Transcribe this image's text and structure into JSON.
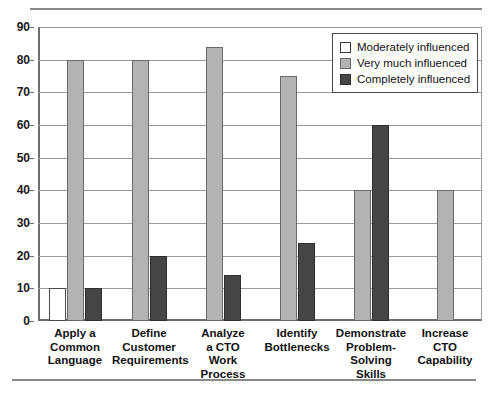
{
  "chart_data": {
    "type": "bar",
    "title": "",
    "xlabel": "",
    "ylabel": "",
    "ylim": [
      0,
      90
    ],
    "ytick_step": 10,
    "yticks": [
      90,
      80,
      70,
      60,
      50,
      40,
      30,
      20,
      10,
      0
    ],
    "grid": true,
    "legend_position": "top-right",
    "categories": [
      "Apply a Common Language",
      "Define Customer Requirements",
      "Analyze a CTO Work Process",
      "Identify Bottlenecks",
      "Demonstrate Problem-Solving Skills",
      "Increase CTO Capability"
    ],
    "category_lines": [
      [
        "Apply a",
        "Common",
        "Language"
      ],
      [
        "Define",
        "Customer",
        "Requirements"
      ],
      [
        "Analyze",
        "a CTO",
        "Work",
        "Process"
      ],
      [
        "Identify",
        "Bottlenecks"
      ],
      [
        "Demonstrate",
        "Problem-",
        "Solving",
        "Skills"
      ],
      [
        "Increase",
        "CTO",
        "Capability"
      ]
    ],
    "series": [
      {
        "name": "Moderately influenced",
        "color": "#ffffff",
        "values": [
          10,
          0,
          0,
          0,
          0,
          0
        ]
      },
      {
        "name": "Very much influenced",
        "color": "#b3b3b3",
        "values": [
          80,
          80,
          84,
          75,
          40,
          40
        ]
      },
      {
        "name": "Completely influenced",
        "color": "#454545",
        "values": [
          10,
          20,
          14,
          24,
          60,
          0
        ]
      }
    ]
  },
  "legend": {
    "items": [
      {
        "label": "Moderately influenced",
        "swatch": "moderate"
      },
      {
        "label": "Very much influenced",
        "swatch": "very"
      },
      {
        "label": "Completely influenced",
        "swatch": "completely"
      }
    ]
  },
  "axis": {
    "y_tick_labels": [
      "90",
      "80",
      "70",
      "60",
      "50",
      "40",
      "30",
      "20",
      "10",
      "0"
    ]
  },
  "title_fragment": ""
}
